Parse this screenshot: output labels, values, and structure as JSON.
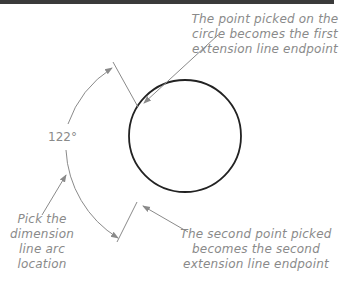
{
  "diagram": {
    "angle_label": "122°",
    "callouts": {
      "first_point": [
        "The point picked on the",
        "circle becomes the first",
        "extension line endpoint"
      ],
      "second_point": [
        "The second point picked",
        "becomes the second",
        "extension line endpoint"
      ],
      "arc_location": [
        "Pick the",
        "dimension",
        "line arc",
        "location"
      ]
    },
    "colors": {
      "circle": "#222222",
      "annotation": "#8a8a8a",
      "top_rule": "#3a3a3a"
    }
  }
}
